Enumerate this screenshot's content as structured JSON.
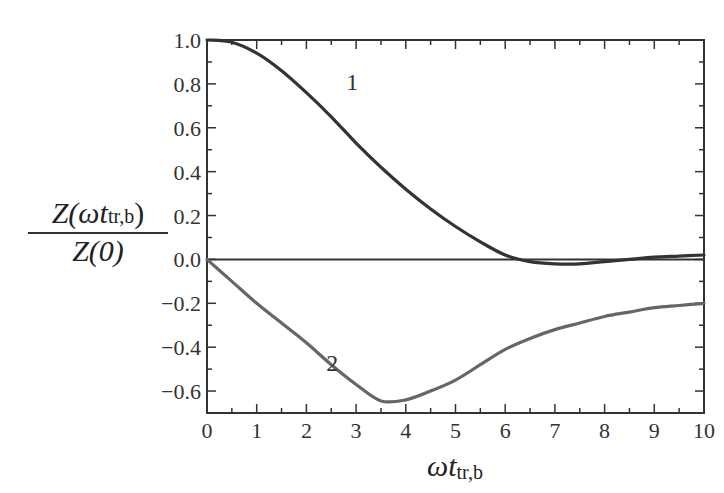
{
  "chart_data": {
    "type": "line",
    "title": "",
    "xlabel": "ωt_tr,b",
    "ylabel": "Z(ωt_tr,b) / Z(0)",
    "xlim": [
      0,
      10
    ],
    "ylim": [
      -0.7,
      1.0
    ],
    "grid": false,
    "legend": "none (curves labeled inline '1' and '2')",
    "x_ticks": [
      0,
      1,
      2,
      3,
      4,
      5,
      6,
      7,
      8,
      9,
      10
    ],
    "y_ticks": [
      -0.6,
      -0.4,
      -0.2,
      0.0,
      0.2,
      0.4,
      0.6,
      0.8,
      1.0
    ],
    "x_tick_labels": [
      "0",
      "1",
      "2",
      "3",
      "4",
      "5",
      "6",
      "7",
      "8",
      "9",
      "10"
    ],
    "y_tick_labels": [
      "−0.6",
      "−0.4",
      "−0.2",
      "0.0",
      "0.2",
      "0.4",
      "0.6",
      "0.8",
      "1.0"
    ],
    "x": [
      0,
      0.5,
      1,
      1.5,
      2,
      2.5,
      3,
      3.5,
      4,
      4.5,
      5,
      5.5,
      6,
      6.5,
      7,
      7.5,
      8,
      8.5,
      9,
      9.5,
      10
    ],
    "series": [
      {
        "name": "1",
        "color": "#333333",
        "values": [
          1.0,
          0.99,
          0.94,
          0.86,
          0.76,
          0.65,
          0.53,
          0.42,
          0.32,
          0.23,
          0.15,
          0.08,
          0.02,
          -0.01,
          -0.02,
          -0.02,
          -0.01,
          0.0,
          0.01,
          0.015,
          0.02
        ]
      },
      {
        "name": "2",
        "color": "#666666",
        "values": [
          0.0,
          -0.1,
          -0.2,
          -0.29,
          -0.38,
          -0.48,
          -0.57,
          -0.645,
          -0.64,
          -0.6,
          -0.55,
          -0.48,
          -0.41,
          -0.36,
          -0.32,
          -0.29,
          -0.26,
          -0.24,
          -0.22,
          -0.21,
          -0.2
        ]
      },
      {
        "name": "zero line",
        "color": "#333333",
        "values": [
          0,
          0,
          0,
          0,
          0,
          0,
          0,
          0,
          0,
          0,
          0,
          0,
          0,
          0,
          0,
          0,
          0,
          0,
          0,
          0,
          0
        ]
      }
    ],
    "annotations": [
      {
        "text": "1",
        "x": 2.8,
        "y": 0.77
      },
      {
        "text": "2",
        "x": 2.4,
        "y": -0.51
      }
    ]
  },
  "labels": {
    "y_num_main": "Z(",
    "y_num_omega": "ωt",
    "y_num_sub": "tr,b",
    "y_num_close": ")",
    "y_den": "Z(0)",
    "x_omega": "ωt",
    "x_sub": "tr,b"
  }
}
